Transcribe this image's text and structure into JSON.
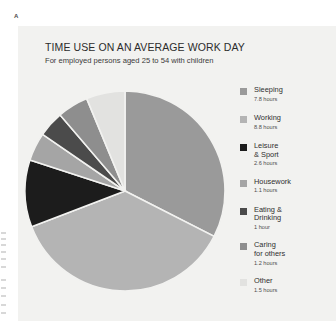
{
  "figure": {
    "label": "A"
  },
  "header": {
    "title": "TIME USE ON AN AVERAGE WORK DAY",
    "subtitle": "For employed persons aged 25 to 54 with children"
  },
  "colors": {
    "panel_background": "#f2f2f0",
    "page_background": "#ffffff",
    "sleeping": "#9a9a9a",
    "working": "#b4b4b4",
    "leisure_sport": "#1c1c1c",
    "housework": "#a5a5a5",
    "eating_drinking": "#4b4b4b",
    "caring_for_others": "#8e8e8e",
    "other": "#e2e2e0",
    "slice_divider": "#f2f2f0",
    "title_text": "#2c2c2c",
    "value_text": "#4d4d4d"
  },
  "chart_data": {
    "type": "pie",
    "title": "TIME USE ON AN AVERAGE WORK DAY",
    "subtitle": "For employed persons aged 25 to 54 with children",
    "unit": "hours",
    "total": 24,
    "start_angle_deg": 0,
    "direction": "clockwise",
    "legend_position": "right",
    "categories": [
      "Sleeping",
      "Working",
      "Leisure & Sport",
      "Housework",
      "Eating & Drinking",
      "Caring for others",
      "Other"
    ],
    "values": [
      7.8,
      8.8,
      2.6,
      1.1,
      1.0,
      1.2,
      1.5
    ],
    "slices": [
      {
        "label": "Sleeping",
        "label_line1": "Sleeping",
        "label_line2": "",
        "value": 7.8,
        "value_text": "7.8 hours",
        "color": "#9a9a9a"
      },
      {
        "label": "Working",
        "label_line1": "Working",
        "label_line2": "",
        "value": 8.8,
        "value_text": "8.8 hours",
        "color": "#b4b4b4"
      },
      {
        "label": "Leisure & Sport",
        "label_line1": "Leisure",
        "label_line2": "& Sport",
        "value": 2.6,
        "value_text": "2.6 hours",
        "color": "#1c1c1c"
      },
      {
        "label": "Housework",
        "label_line1": "Housework",
        "label_line2": "",
        "value": 1.1,
        "value_text": "1.1 hours",
        "color": "#a5a5a5"
      },
      {
        "label": "Eating & Drinking",
        "label_line1": "Eating &",
        "label_line2": "Drinking",
        "value": 1.0,
        "value_text": "1 hour",
        "color": "#4b4b4b"
      },
      {
        "label": "Caring for others",
        "label_line1": "Caring",
        "label_line2": "for others",
        "value": 1.2,
        "value_text": "1.2 hours",
        "color": "#8e8e8e"
      },
      {
        "label": "Other",
        "label_line1": "Other",
        "label_line2": "",
        "value": 1.5,
        "value_text": "1.5 hours",
        "color": "#e2e2e0"
      }
    ]
  }
}
